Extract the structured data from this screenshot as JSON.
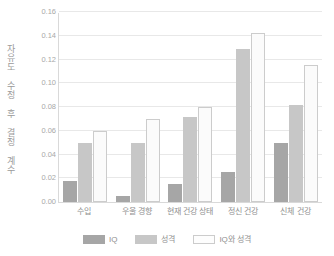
{
  "chart_data": {
    "type": "bar",
    "title": "",
    "subtitle": "",
    "xlabel": "",
    "ylabel": "자유도 수정 후 결정 계수",
    "categories": [
      "수입",
      "우울 경향",
      "현재 건강 상태",
      "정신 건강",
      "신체 건강"
    ],
    "series": [
      {
        "name": "IQ",
        "color": "#a6a6a6",
        "values": [
          0.018,
          0.005,
          0.015,
          0.025,
          0.05
        ]
      },
      {
        "name": "성격",
        "color": "#c7c7c7",
        "values": [
          0.05,
          0.05,
          0.072,
          0.129,
          0.082
        ]
      },
      {
        "name": "IQ와 성격",
        "color": "#fbfbfb",
        "values": [
          0.06,
          0.07,
          0.08,
          0.142,
          0.115
        ]
      }
    ],
    "ylim": [
      0.0,
      0.16
    ],
    "ytick_values": [
      0.0,
      0.02,
      0.04,
      0.06,
      0.08,
      0.1,
      0.12,
      0.14,
      0.16
    ],
    "ytick_labels": [
      "0.00",
      "0.02",
      "0.04",
      "0.06",
      "0.08",
      "0.10",
      "0.12",
      "0.14",
      "0.16"
    ],
    "grid": true,
    "legend_position": "bottom",
    "background": "#ffffff",
    "gridline_color": "#e8e8e8",
    "axis_color": "#d9d9d9",
    "text_color": "#8f8f8f"
  }
}
